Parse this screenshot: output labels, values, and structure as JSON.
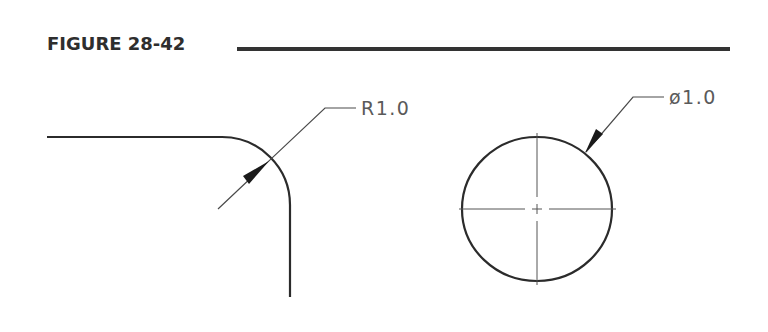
{
  "figure": {
    "title": "FIGURE 28-42",
    "rule_color": "#333333"
  },
  "left_view": {
    "description": "Rounded corner with radius dimension",
    "dimension_label": "R1.0",
    "dimension_type": "radius"
  },
  "right_view": {
    "description": "Circle with center lines and diameter dimension",
    "dimension_label": "ø1.0",
    "dimension_type": "diameter"
  },
  "colors": {
    "outline": "#2b2b2b",
    "leader": "#4a4a4a",
    "centerline": "#555555",
    "text": "#5a5a5a"
  }
}
